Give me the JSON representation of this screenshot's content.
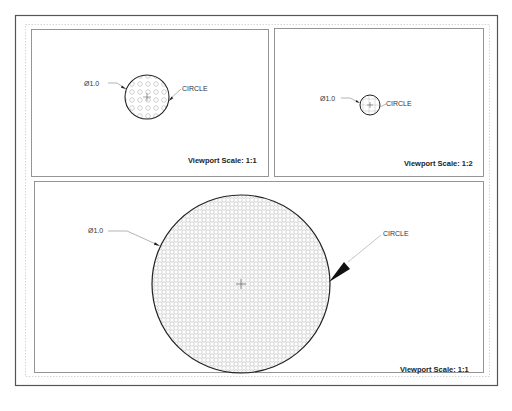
{
  "drawing": {
    "colors": {
      "sheet_border": "#555555",
      "viewport_border": "#8a8a8a",
      "margin_dotted": "#bdbdbd",
      "circle_stroke": "#222222",
      "hatch": "#9a9a9a",
      "leader": "#666666"
    },
    "viewports": [
      {
        "id": "vp1",
        "scale_label": "Viewport Scale: 1:1",
        "dimension_label": "Ø1.0",
        "object_label": "CIRCLE",
        "circle": {
          "cx": 147,
          "cy": 97,
          "r": 22
        }
      },
      {
        "id": "vp2",
        "scale_label": "Viewport Scale: 1:2",
        "dimension_label": "Ø1.0",
        "object_label": "CIRCLE",
        "circle": {
          "cx": 370,
          "cy": 105,
          "r": 10
        }
      },
      {
        "id": "vp3",
        "scale_label": "Viewport Scale: 1:1",
        "dimension_label": "Ø1.0",
        "object_label": "CIRCLE",
        "circle": {
          "cx": 241,
          "cy": 284,
          "r": 89
        }
      }
    ]
  }
}
